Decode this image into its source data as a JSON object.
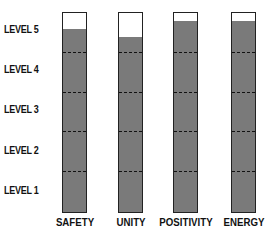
{
  "chart_data": {
    "type": "bar",
    "title": "",
    "xlabel": "",
    "ylabel": "",
    "categories": [
      "SAFETY",
      "UNITY",
      "POSITIVITY",
      "ENERGY"
    ],
    "values": [
      4.6,
      4.4,
      4.8,
      4.8
    ],
    "ylim": [
      0,
      5
    ],
    "y_tick_labels": [
      "LEVEL 1",
      "LEVEL 2",
      "LEVEL 3",
      "LEVEL 4",
      "LEVEL 5"
    ],
    "grid": "dashed level dividers inside bars",
    "legend": null,
    "colors": {
      "fill": "#7a7a7a",
      "border": "#222222"
    }
  },
  "levels": [
    "LEVEL 5",
    "LEVEL 4",
    "LEVEL 3",
    "LEVEL 2",
    "LEVEL 1"
  ],
  "categories": [
    "SAFETY",
    "UNITY",
    "POSITIVITY",
    "ENERGY"
  ]
}
